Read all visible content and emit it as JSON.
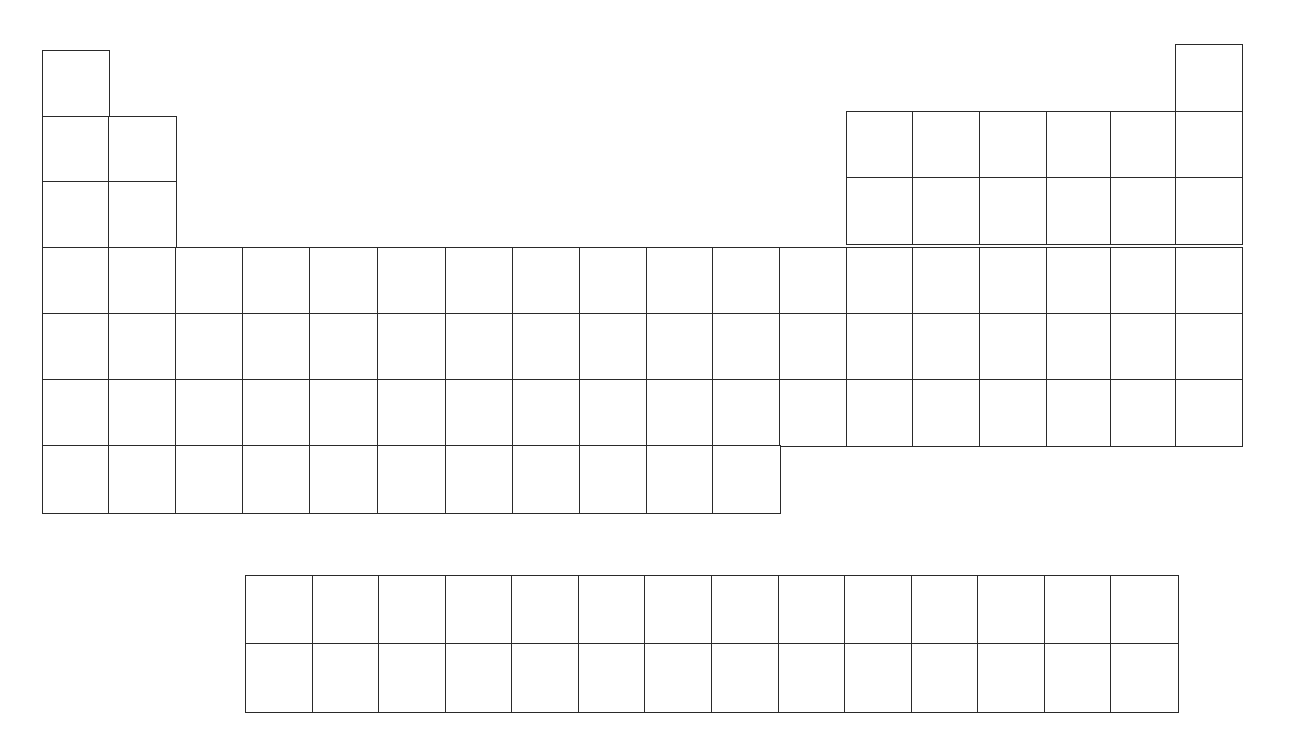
{
  "diagram": {
    "type": "blank periodic table outline",
    "main_table": {
      "periods": 7,
      "groups": 18,
      "cells_per_period": [
        2,
        8,
        8,
        18,
        18,
        18,
        11
      ]
    },
    "f_block": {
      "rows": 2,
      "columns": 14
    },
    "line_color": "#2a2a2a",
    "background": "#ffffff"
  }
}
